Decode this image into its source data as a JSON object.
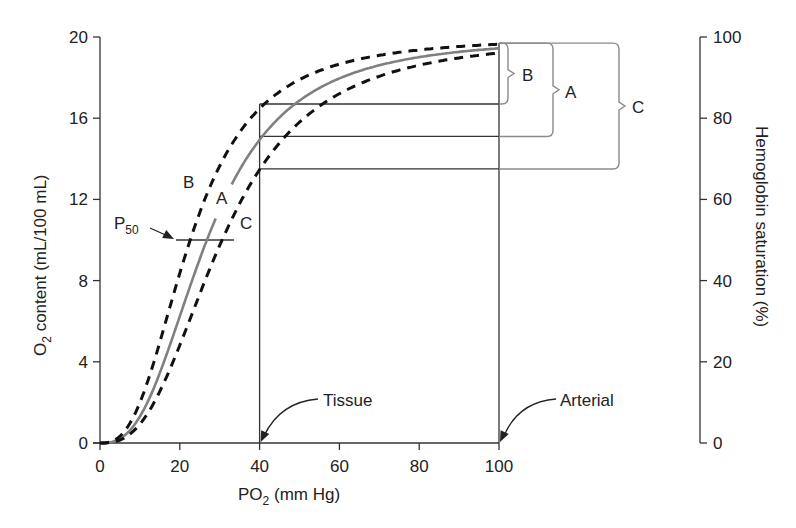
{
  "chart_data": {
    "type": "line",
    "title": "",
    "xlabel": "PO2 (mm Hg)",
    "xlabel_main": "PO",
    "xlabel_sub": "2",
    "xlabel_rest": " (mm Hg)",
    "ylabel": "O2 content (mL/100 mL)",
    "ylabel_main": "O",
    "ylabel_sub": "2",
    "ylabel_rest": " content (mL/100 mL)",
    "y2label": "Hemoglobin saturation (%)",
    "xlim": [
      0,
      100
    ],
    "ylim": [
      0,
      20
    ],
    "y2lim": [
      0,
      100
    ],
    "xticks": [
      0,
      20,
      40,
      60,
      80,
      100
    ],
    "yticks": [
      0,
      4,
      8,
      12,
      16,
      20
    ],
    "y2ticks": [
      0,
      20,
      40,
      60,
      80,
      100
    ],
    "grid": false,
    "hill_n": 2.7,
    "max_content": 20,
    "series": [
      {
        "name": "A",
        "style": "solid",
        "color": "#808080",
        "p50": 26.8,
        "x": [
          0,
          5,
          10,
          15,
          20,
          25,
          30,
          35,
          40,
          50,
          60,
          70,
          80,
          90,
          100
        ],
        "values": [
          0,
          0.2,
          1.3,
          3.4,
          6.1,
          9.0,
          11.5,
          13.6,
          15.0,
          16.9,
          18.0,
          18.7,
          19.1,
          19.4,
          19.6
        ]
      },
      {
        "name": "B",
        "style": "dashed",
        "color": "#111111",
        "p50": 22.6,
        "x": [
          0,
          5,
          10,
          15,
          20,
          25,
          30,
          35,
          40,
          50,
          60,
          70,
          80,
          90,
          100
        ],
        "values": [
          0,
          0.3,
          2.1,
          5.0,
          8.4,
          11.4,
          13.7,
          15.3,
          16.5,
          17.9,
          18.7,
          19.1,
          19.4,
          19.6,
          19.7
        ]
      },
      {
        "name": "C",
        "style": "dashed",
        "color": "#111111",
        "p50": 30.6,
        "x": [
          0,
          5,
          10,
          15,
          20,
          25,
          30,
          35,
          40,
          50,
          60,
          70,
          80,
          90,
          100
        ],
        "values": [
          0,
          0.1,
          0.9,
          2.4,
          4.5,
          7.0,
          9.6,
          11.8,
          13.5,
          15.9,
          17.3,
          18.2,
          18.7,
          19.1,
          19.4
        ]
      }
    ],
    "reference_lines": {
      "tissue_po2": 40,
      "arterial_po2": 100,
      "tissue_content": {
        "B": 16.7,
        "A": 15.1,
        "C": 13.5
      },
      "arterial_content": 19.7,
      "p50_content": 10
    },
    "annotations": {
      "p50_label_main": "P",
      "p50_label_sub": "50",
      "curve_label_b": "B",
      "curve_label_a": "A",
      "curve_label_c": "C",
      "bracket_label_b": "B",
      "bracket_label_a": "A",
      "bracket_label_c": "C",
      "tissue": "Tissue",
      "arterial": "Arterial"
    }
  }
}
